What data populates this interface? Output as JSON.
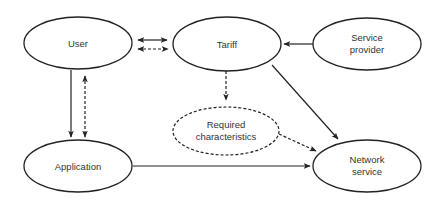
{
  "diagram": {
    "nodes": {
      "user": {
        "label": "User",
        "style": "solid"
      },
      "tariff": {
        "label": "Tariff",
        "style": "solid"
      },
      "service_provider": {
        "label_line1": "Service",
        "label_line2": "provider",
        "style": "solid"
      },
      "application": {
        "label": "Application",
        "style": "solid"
      },
      "required_characteristics": {
        "label_line1": "Required",
        "label_line2": "characteristics",
        "style": "dashed"
      },
      "network_service": {
        "label_line1": "Network",
        "label_line2": "service",
        "style": "solid"
      }
    },
    "edges": [
      {
        "from": "User",
        "to": "Tariff",
        "style": "solid",
        "direction": "bidirectional"
      },
      {
        "from": "User",
        "to": "Tariff",
        "style": "dashed",
        "direction": "bidirectional"
      },
      {
        "from": "User",
        "to": "Application",
        "style": "solid",
        "direction": "forward"
      },
      {
        "from": "Application",
        "to": "User",
        "style": "dashed",
        "direction": "bidirectional"
      },
      {
        "from": "Service provider",
        "to": "Tariff",
        "style": "solid",
        "direction": "forward"
      },
      {
        "from": "Tariff",
        "to": "Required characteristics",
        "style": "dashed",
        "direction": "forward"
      },
      {
        "from": "Tariff",
        "to": "Network service",
        "style": "solid",
        "direction": "forward"
      },
      {
        "from": "Required characteristics",
        "to": "Network service",
        "style": "dashed",
        "direction": "forward"
      },
      {
        "from": "Application",
        "to": "Network service",
        "style": "solid",
        "direction": "forward"
      }
    ]
  }
}
